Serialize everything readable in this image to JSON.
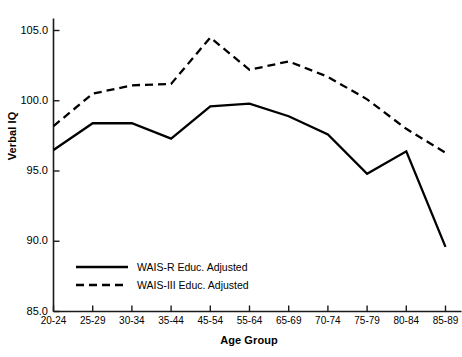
{
  "chart_data": {
    "type": "line",
    "title": "",
    "xlabel": "Age Group",
    "ylabel": "Verbal IQ",
    "categories": [
      "20-24",
      "25-29",
      "30-34",
      "35-44",
      "45-54",
      "55-64",
      "65-69",
      "70-74",
      "75-79",
      "80-84",
      "85-89"
    ],
    "ylim": [
      85.0,
      105.0
    ],
    "ytick_labels": [
      "85.0",
      "90.0",
      "95.0",
      "100.0",
      "105.0"
    ],
    "ytick_values": [
      85.0,
      90.0,
      95.0,
      100.0,
      105.0
    ],
    "grid": false,
    "legend_position": "bottom-left",
    "series": [
      {
        "name": "WAIS-R Educ. Adjusted",
        "style": "solid",
        "color": "#000000",
        "values": [
          96.5,
          98.4,
          98.4,
          97.3,
          99.6,
          99.8,
          98.9,
          97.6,
          94.8,
          96.4,
          89.6
        ]
      },
      {
        "name": "WAIS-III Educ. Adjusted",
        "style": "dashed",
        "color": "#000000",
        "values": [
          98.2,
          100.5,
          101.1,
          101.2,
          104.5,
          102.2,
          102.8,
          101.7,
          100.1,
          98.0,
          96.3
        ]
      }
    ]
  },
  "axes": {
    "y_title": "Verbal IQ",
    "x_title": "Age Group"
  },
  "legend": {
    "entries": [
      {
        "label": "WAIS-R Educ. Adjusted"
      },
      {
        "label": "WAIS-III Educ. Adjusted"
      }
    ]
  },
  "colors": {
    "axis": "#1a1a1a",
    "line": "#000000",
    "background": "#ffffff"
  }
}
